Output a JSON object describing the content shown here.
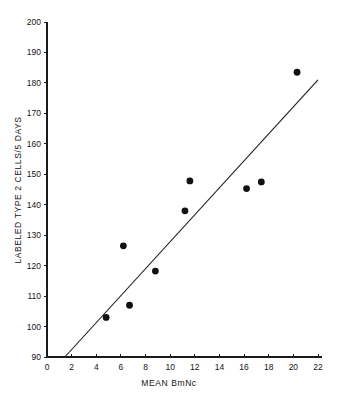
{
  "chart_data": {
    "type": "scatter",
    "title": "",
    "subtitle": "",
    "xlabel": "MEAN BmNc",
    "ylabel": "LABELED TYPE 2 CELLS/5 DAYS",
    "xlim": [
      0,
      22
    ],
    "ylim": [
      90,
      200
    ],
    "xticks": [
      0,
      2,
      4,
      6,
      8,
      10,
      12,
      14,
      16,
      18,
      20,
      22
    ],
    "yticks": [
      90,
      100,
      110,
      120,
      130,
      140,
      150,
      160,
      170,
      180,
      190,
      200
    ],
    "xtick_labels": [
      "0",
      "2",
      "4",
      "6",
      "8",
      "10",
      "12",
      "14",
      "16",
      "18",
      "20",
      "22"
    ],
    "ytick_labels": [
      "90",
      "100",
      "110",
      "120",
      "130",
      "140",
      "150",
      "160",
      "170",
      "180",
      "190",
      "200"
    ],
    "grid": false,
    "legend": null,
    "legend_position": "none",
    "marker": "filled-circle",
    "marker_color": "#111111",
    "points": [
      {
        "x": 4.8,
        "y": 103.0
      },
      {
        "x": 6.2,
        "y": 126.5
      },
      {
        "x": 6.7,
        "y": 107.0
      },
      {
        "x": 8.8,
        "y": 118.2
      },
      {
        "x": 11.2,
        "y": 138.0
      },
      {
        "x": 11.6,
        "y": 147.8
      },
      {
        "x": 16.2,
        "y": 145.3
      },
      {
        "x": 17.4,
        "y": 147.5
      },
      {
        "x": 20.3,
        "y": 183.5
      }
    ],
    "series": [
      {
        "name": "observations",
        "x": [
          4.8,
          6.2,
          6.7,
          8.8,
          11.2,
          11.6,
          16.2,
          17.4,
          20.3
        ],
        "values": [
          103.0,
          126.5,
          107.0,
          118.2,
          138.0,
          147.8,
          145.3,
          147.5,
          183.5
        ]
      }
    ],
    "fit_line": {
      "type": "line",
      "name": "regression-line",
      "x": [
        1.45,
        22.0
      ],
      "values": [
        90.0,
        181.0
      ],
      "color": "#1a1a1a"
    },
    "axis_color": "#1a1a1a",
    "background": "#ffffff"
  },
  "axes": {
    "x_axis_title": "MEAN BmNc",
    "y_axis_title": "LABELED TYPE 2 CELLS/5 DAYS"
  }
}
